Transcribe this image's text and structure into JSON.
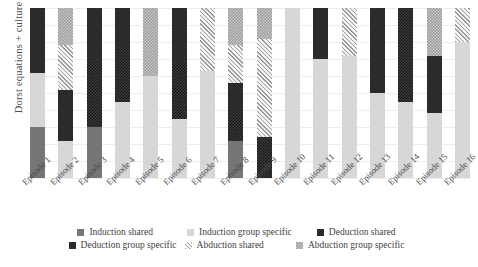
{
  "chart_data": {
    "type": "bar",
    "subtype": "stacked-bar-100",
    "title": "",
    "xlabel": "",
    "ylabel": "Dorst equations + culture",
    "ylim": [
      0,
      100
    ],
    "grid": true,
    "legend_position": "bottom",
    "categories": [
      "Episode 1",
      "Episode 2",
      "Episode 3",
      "Episode 4",
      "Episode 5",
      "Episode 6",
      "Episode 7",
      "Episode 8",
      "Episode 9",
      "Episode 10",
      "Episode 11",
      "Episode 12",
      "Episode 13",
      "Episode 14",
      "Episode 15",
      "Episode 16"
    ],
    "series": [
      {
        "name": "Induction shared",
        "key": "ind_shared",
        "color": "#767676",
        "values": [
          30,
          0,
          30,
          0,
          0,
          0,
          0,
          22,
          0,
          0,
          0,
          0,
          0,
          0,
          0,
          0
        ]
      },
      {
        "name": "Induction group specific",
        "key": "ind_group",
        "color": "#d7d7d7",
        "values": [
          32,
          22,
          0,
          45,
          60,
          35,
          63,
          0,
          0,
          100,
          70,
          72,
          50,
          45,
          38,
          80
        ]
      },
      {
        "name": "Deduction shared",
        "key": "ded_shared",
        "color": "#3c3c3c",
        "values": [
          0,
          0,
          40,
          32,
          0,
          33,
          0,
          17,
          24,
          0,
          0,
          0,
          0,
          55,
          0,
          0
        ]
      },
      {
        "name": "Deduction group specific",
        "key": "ded_group",
        "color": "#2b2b2b",
        "values": [
          38,
          30,
          30,
          23,
          0,
          32,
          0,
          17,
          0,
          0,
          30,
          0,
          50,
          0,
          34,
          0
        ]
      },
      {
        "name": "Abduction shared",
        "key": "abd_shared",
        "color": "#f2f2f2",
        "values": [
          0,
          26,
          0,
          0,
          0,
          0,
          37,
          22,
          58,
          0,
          0,
          28,
          0,
          0,
          0,
          20
        ]
      },
      {
        "name": "Abduction group specific",
        "key": "abd_group",
        "color": "#9d9d9d",
        "values": [
          0,
          22,
          0,
          0,
          40,
          0,
          0,
          22,
          18,
          0,
          0,
          0,
          0,
          0,
          28,
          0
        ]
      }
    ],
    "stack_order": [
      "ind_shared",
      "ind_group",
      "ded_shared",
      "ded_group",
      "abd_shared",
      "abd_group"
    ],
    "bars": [
      {
        "category": "Episode 1",
        "segments": [
          {
            "key": "ind_shared",
            "value": 30
          },
          {
            "key": "ind_group",
            "value": 32
          },
          {
            "key": "ded_group",
            "value": 38
          }
        ]
      },
      {
        "category": "Episode 2",
        "segments": [
          {
            "key": "ind_group",
            "value": 22
          },
          {
            "key": "ded_group",
            "value": 30
          },
          {
            "key": "abd_shared",
            "value": 26
          },
          {
            "key": "abd_group",
            "value": 22
          }
        ]
      },
      {
        "category": "Episode 3",
        "segments": [
          {
            "key": "ind_shared",
            "value": 30
          },
          {
            "key": "ded_shared",
            "value": 40
          },
          {
            "key": "ded_group",
            "value": 30
          }
        ]
      },
      {
        "category": "Episode 4",
        "segments": [
          {
            "key": "ind_group",
            "value": 45
          },
          {
            "key": "ded_shared",
            "value": 32
          },
          {
            "key": "ded_group",
            "value": 23
          }
        ]
      },
      {
        "category": "Episode 5",
        "segments": [
          {
            "key": "ind_group",
            "value": 60
          },
          {
            "key": "abd_group",
            "value": 40
          }
        ]
      },
      {
        "category": "Episode 6",
        "segments": [
          {
            "key": "ind_group",
            "value": 35
          },
          {
            "key": "ded_shared",
            "value": 33
          },
          {
            "key": "ded_group",
            "value": 32
          }
        ]
      },
      {
        "category": "Episode 7",
        "segments": [
          {
            "key": "ind_group",
            "value": 63
          },
          {
            "key": "abd_shared",
            "value": 37
          }
        ]
      },
      {
        "category": "Episode 8",
        "segments": [
          {
            "key": "ind_shared",
            "value": 22
          },
          {
            "key": "ded_shared",
            "value": 17
          },
          {
            "key": "ded_group",
            "value": 17
          },
          {
            "key": "abd_shared",
            "value": 22
          },
          {
            "key": "abd_group",
            "value": 22
          }
        ]
      },
      {
        "category": "Episode 9",
        "segments": [
          {
            "key": "ded_shared",
            "value": 24
          },
          {
            "key": "abd_shared",
            "value": 58
          },
          {
            "key": "abd_group",
            "value": 18
          }
        ]
      },
      {
        "category": "Episode 10",
        "segments": [
          {
            "key": "ind_group",
            "value": 100
          }
        ]
      },
      {
        "category": "Episode 11",
        "segments": [
          {
            "key": "ind_group",
            "value": 70
          },
          {
            "key": "ded_group",
            "value": 30
          }
        ]
      },
      {
        "category": "Episode 12",
        "segments": [
          {
            "key": "ind_group",
            "value": 72
          },
          {
            "key": "abd_shared",
            "value": 28
          }
        ]
      },
      {
        "category": "Episode 13",
        "segments": [
          {
            "key": "ind_group",
            "value": 50
          },
          {
            "key": "ded_group",
            "value": 50
          }
        ]
      },
      {
        "category": "Episode 14",
        "segments": [
          {
            "key": "ind_group",
            "value": 45
          },
          {
            "key": "ded_shared",
            "value": 55
          }
        ]
      },
      {
        "category": "Episode 15",
        "segments": [
          {
            "key": "ind_group",
            "value": 38
          },
          {
            "key": "ded_group",
            "value": 34
          },
          {
            "key": "abd_group",
            "value": 28
          }
        ]
      },
      {
        "category": "Episode 16",
        "segments": [
          {
            "key": "ind_group",
            "value": 80
          },
          {
            "key": "abd_shared",
            "value": 20
          }
        ]
      }
    ],
    "legend": [
      {
        "label": "Induction shared",
        "key": "ind_shared"
      },
      {
        "label": "Induction group specific",
        "key": "ind_group"
      },
      {
        "label": "Deduction shared",
        "key": "ded_shared"
      },
      {
        "label": "Deduction group specific",
        "key": "ded_group"
      },
      {
        "label": "Abduction shared",
        "key": "abd_shared"
      },
      {
        "label": "Abduction group specific",
        "key": "abd_group"
      }
    ]
  }
}
